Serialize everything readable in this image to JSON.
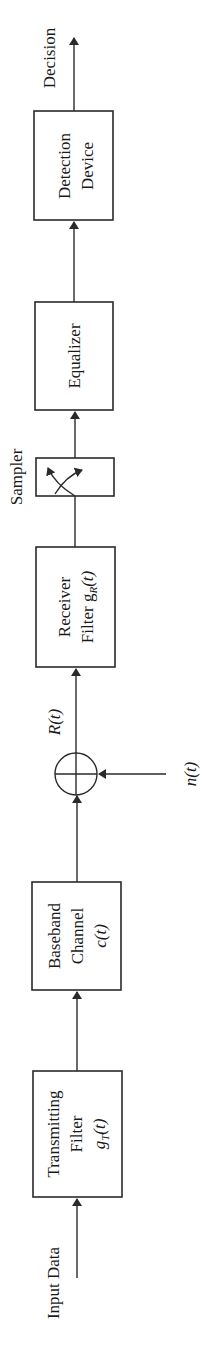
{
  "diagram": {
    "orientation": "rotated -90deg, signal flows bottom to top",
    "colors": {
      "stroke": "#2a2a2a",
      "text": "#1a1a1a",
      "background": "#ffffff"
    },
    "input_label": "Input Data",
    "output_label": "Decision",
    "blocks": [
      {
        "id": "transmitting-filter",
        "line1": "Transmitting",
        "line2": "Filter",
        "line3": "g",
        "sub3": "T",
        "suffix3": "(t)"
      },
      {
        "id": "baseband-channel",
        "line1": "Baseband",
        "line2": "Channel",
        "line3": "c(t)"
      },
      {
        "id": "receiver-filter",
        "line1": "Receiver",
        "line2": "Filter g",
        "sub2": "R",
        "suffix2": "(t)"
      },
      {
        "id": "sampler",
        "label": "Sampler"
      },
      {
        "id": "equalizer",
        "line1": "Equalizer"
      },
      {
        "id": "detection-device",
        "line1": "Detection",
        "line2": "Device"
      }
    ],
    "summer": {
      "id": "adder",
      "output_label": "R(t)",
      "noise_label": "n(t)"
    }
  }
}
